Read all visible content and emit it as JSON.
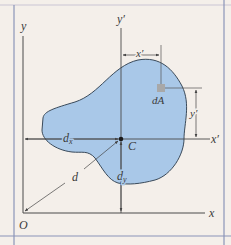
{
  "figure": {
    "colors": {
      "background": "#f4efea",
      "frame": "#8a94b8",
      "shape_fill": "#a9c8e8",
      "shape_stroke": "#3a4a5a",
      "axis": "#4a4a4a",
      "dim_line": "#555555",
      "element": "#a8a8a8"
    },
    "labels": {
      "y_axis": "y",
      "x_axis": "x",
      "origin": "O",
      "y_prime_axis": "y′",
      "x_prime_axis": "x′",
      "centroid": "C",
      "area_element": "dA",
      "x_prime_dim": "x′",
      "y_prime_dim": "y′",
      "dx": "d",
      "dx_sub": "x",
      "dy": "d",
      "dy_sub": "y",
      "d": "d"
    }
  }
}
